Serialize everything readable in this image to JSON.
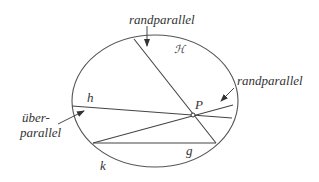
{
  "diagram": {
    "labels": {
      "randparallel_top": "randparallel",
      "randparallel_right": "randparallel",
      "region": "ℋ",
      "h": "h",
      "P": "P",
      "ueberparallel_1": "über-",
      "ueberparallel_2": "parallel",
      "g": "g",
      "k": "k"
    },
    "colors": {
      "stroke": "#444444",
      "text": "#333333"
    }
  }
}
